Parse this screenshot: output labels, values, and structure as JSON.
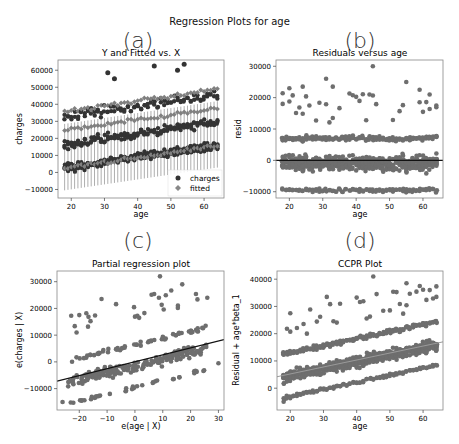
{
  "figure": {
    "suptitle": "Regression Plots for age",
    "colors": {
      "points": "#6e6e6e",
      "charges": "#333333",
      "fitted": "#808080",
      "line": "#111111",
      "frame": "#888888",
      "ccpr_line": "#9a9a9a"
    }
  },
  "panels": {
    "a": {
      "letter": "(a)",
      "title": "Y and Fitted vs. X",
      "xlabel": "age",
      "ylabel": "charges",
      "legend": [
        "charges",
        "fitted"
      ],
      "xticks": [
        "20",
        "30",
        "40",
        "50",
        "60"
      ],
      "yticks": [
        "60000",
        "50000",
        "40000",
        "30000",
        "20000",
        "10000",
        "0",
        "−10000"
      ]
    },
    "b": {
      "letter": "(b)",
      "title": "Residuals versus age",
      "xlabel": "age",
      "ylabel": "resid",
      "xticks": [
        "20",
        "30",
        "40",
        "50",
        "60"
      ],
      "yticks": [
        "30000",
        "20000",
        "10000",
        "0",
        "−10000"
      ]
    },
    "c": {
      "letter": "(c)",
      "title": "Partial regression plot",
      "xlabel": "e(age | X)",
      "ylabel": "e(charges | X)",
      "xticks": [
        "−20",
        "−10",
        "0",
        "10",
        "20",
        "30"
      ],
      "yticks": [
        "30000",
        "20000",
        "10000",
        "0",
        "−10000"
      ]
    },
    "d": {
      "letter": "(d)",
      "title": "CCPR Plot",
      "xlabel": "age",
      "ylabel": "Residual + age*beta_1",
      "xticks": [
        "20",
        "30",
        "40",
        "50",
        "60"
      ],
      "yticks": [
        "40000",
        "30000",
        "20000",
        "10000",
        "0"
      ]
    }
  },
  "chart_data": [
    {
      "type": "scatter",
      "title": "Y and Fitted vs. X",
      "xlabel": "age",
      "ylabel": "charges",
      "xlim": [
        16,
        66
      ],
      "ylim": [
        -15000,
        66000
      ],
      "legend": [
        "charges",
        "fitted"
      ],
      "legend_position": "lower right",
      "series": [
        {
          "name": "charges",
          "note": "bands near 2000-15000, 15000-25000, 35000-50000; outliers ~63000 at ages 45 and 54",
          "x": [
            31,
            33,
            45,
            52,
            54,
            18,
            30,
            40,
            50,
            60,
            64
          ],
          "y": [
            58500,
            55000,
            62500,
            60000,
            63500,
            39000,
            40000,
            42000,
            46000,
            48000,
            49000
          ]
        },
        {
          "name": "fitted",
          "note": "rising trend with error bars, approx 3000 at age 18 to 16000 at age 64",
          "x": [
            18,
            30,
            40,
            50,
            64
          ],
          "y": [
            3000,
            7000,
            10000,
            12500,
            16000
          ]
        }
      ]
    },
    {
      "type": "scatter",
      "title": "Residuals versus age",
      "xlabel": "age",
      "ylabel": "resid",
      "xlim": [
        16,
        66
      ],
      "ylim": [
        -12000,
        32000
      ],
      "hline": 0,
      "note": "dense bands around 7000 and -3000 to 3000 and -9500; outliers up to 30000",
      "x": [
        18,
        20,
        24,
        31,
        33,
        45,
        55,
        59,
        62,
        64
      ],
      "y": [
        18000,
        23000,
        23500,
        26000,
        23500,
        30000,
        25000,
        22500,
        21000,
        17500
      ]
    },
    {
      "type": "scatter",
      "title": "Partial regression plot",
      "xlabel": "e(age | X)",
      "ylabel": "e(charges | X)",
      "xlim": [
        -28,
        32
      ],
      "ylim": [
        -18000,
        34000
      ],
      "fit_line": {
        "x": [
          -28,
          32
        ],
        "y": [
          -7200,
          8300
        ]
      },
      "x": [
        -26,
        -20,
        -12,
        9,
        17,
        26,
        30
      ],
      "y": [
        -15000,
        17500,
        23500,
        32000,
        29000,
        24000,
        -500
      ]
    },
    {
      "type": "scatter",
      "title": "CCPR Plot",
      "xlabel": "age",
      "ylabel": "Residual + age*beta_1",
      "xlim": [
        16,
        66
      ],
      "ylim": [
        -8000,
        43000
      ],
      "fit_line": {
        "x": [
          16,
          66
        ],
        "y": [
          4200,
          17000
        ]
      },
      "x": [
        18,
        20,
        31,
        45,
        55,
        59,
        62,
        64
      ],
      "y": [
        -5000,
        27500,
        33500,
        41000,
        38500,
        37500,
        36000,
        33500
      ]
    }
  ]
}
